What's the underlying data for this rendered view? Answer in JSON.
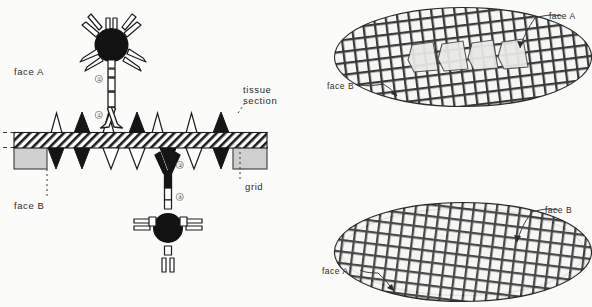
{
  "figure": {
    "background_color": "#fbfbf9",
    "ink_color": "#222222",
    "gold_color": "#151515",
    "grid_fill": "#cfcfcf",
    "section_fill": "#e2e2e2"
  },
  "left_panel": {
    "name": "section-cross-section-diagram",
    "labels": {
      "face_a": "face A",
      "face_b": "face B",
      "tissue_section": "tissue\nsection",
      "tissue_section_line1": "tissue",
      "tissue_section_line2": "section",
      "grid": "grid"
    },
    "step_markers": [
      {
        "id": "marker-1",
        "label": "①",
        "meaning": "primary antibody on face A"
      },
      {
        "id": "marker-2",
        "label": "②",
        "meaning": "gold-conjugated secondary antibody on face A"
      },
      {
        "id": "marker-3",
        "label": "③",
        "meaning": "primary antibody on face B"
      },
      {
        "id": "marker-4",
        "label": "④",
        "meaning": "gold-conjugated secondary antibody on face B"
      }
    ],
    "antigen_count_up": 4,
    "antigen_count_down": 5,
    "gold_particles": 2
  },
  "right_panels": [
    {
      "name": "grid-view-face-a-up",
      "labels": {
        "top_right": "face A",
        "left": "face B"
      },
      "ribbon_sections": 4,
      "orientation": "face A uppermost"
    },
    {
      "name": "grid-view-face-b-up",
      "labels": {
        "top_right": "face B",
        "left": "face A"
      },
      "ribbon_sections": 4,
      "orientation": "face B uppermost (grid inverted)"
    }
  ]
}
